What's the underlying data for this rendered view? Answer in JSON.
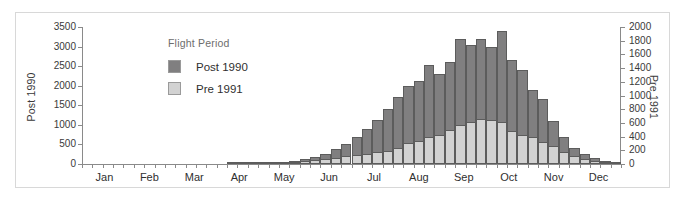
{
  "chart_data": {
    "type": "bar",
    "title": "",
    "subtitle": "",
    "xlabel": "",
    "ylabel": "Post 1990",
    "y2label": "Pre 1991",
    "grid": false,
    "legend_position": "inside-top-left",
    "legend_title": "Flight Period",
    "x_tick_labels": [
      "Jan",
      "Feb",
      "Mar",
      "Apr",
      "May",
      "Jun",
      "Jul",
      "Aug",
      "Sep",
      "Oct",
      "Nov",
      "Dec"
    ],
    "x_axis_note": "weekly bins across the calendar year",
    "ylim": [
      0,
      3500
    ],
    "y_tick_labels": [
      "0",
      "500",
      "1000",
      "1500",
      "2000",
      "2500",
      "3000",
      "3500"
    ],
    "y_ticks": [
      0,
      500,
      1000,
      1500,
      2000,
      2500,
      3000,
      3500
    ],
    "y2lim": [
      0,
      2000
    ],
    "y2_tick_labels": [
      "0",
      "200",
      "400",
      "600",
      "800",
      "1000",
      "1200",
      "1400",
      "1600",
      "1800",
      "2000"
    ],
    "y2_ticks": [
      0,
      200,
      400,
      600,
      800,
      1000,
      1200,
      1400,
      1600,
      1800,
      2000
    ],
    "bin_count": 52,
    "series": [
      {
        "name": "Post 1990",
        "axis": "left",
        "color": "#807f80",
        "edge_color": "#5c5c5c",
        "values": [
          0,
          0,
          0,
          0,
          0,
          0,
          0,
          0,
          0,
          0,
          0,
          0,
          0,
          0,
          20,
          20,
          30,
          30,
          40,
          60,
          80,
          120,
          180,
          260,
          380,
          520,
          700,
          900,
          1120,
          1400,
          1720,
          2000,
          2120,
          2520,
          2300,
          2600,
          3200,
          3050,
          3200,
          3000,
          3400,
          2650,
          2400,
          1900,
          1650,
          1100,
          700,
          420,
          260,
          150,
          80,
          30
        ]
      },
      {
        "name": "Pre 1991",
        "axis": "right",
        "color": "#d2d2d2",
        "edge_color": "#5c5c5c",
        "values": [
          0,
          0,
          0,
          0,
          0,
          0,
          0,
          0,
          0,
          0,
          0,
          0,
          0,
          0,
          10,
          10,
          15,
          15,
          20,
          25,
          35,
          50,
          60,
          75,
          90,
          110,
          130,
          150,
          170,
          195,
          230,
          300,
          340,
          400,
          430,
          500,
          570,
          620,
          660,
          640,
          620,
          480,
          430,
          390,
          320,
          260,
          180,
          120,
          70,
          40,
          20,
          10
        ]
      }
    ]
  }
}
